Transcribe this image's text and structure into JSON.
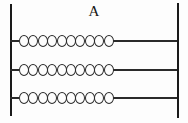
{
  "figure": {
    "title": "A",
    "background_color": "#fdfdfd",
    "stroke_color": "#2b2b2b",
    "width": 188,
    "height": 123
  },
  "vertical_rails": [
    {
      "name": "left-rail",
      "position": "left"
    },
    {
      "name": "right-rail",
      "position": "right"
    }
  ],
  "rows": [
    {
      "id": "row-1",
      "bead_count": 10,
      "bead_glyph": "O",
      "has_left_stub": true,
      "has_right_tail": true
    },
    {
      "id": "row-2",
      "bead_count": 10,
      "bead_glyph": "O",
      "has_left_stub": true,
      "has_right_tail": true
    },
    {
      "id": "row-3",
      "bead_count": 10,
      "bead_glyph": "O",
      "has_left_stub": true,
      "has_right_tail": true
    }
  ],
  "chart_data": {
    "type": "diagram",
    "title": "A",
    "categories": [
      "row-1",
      "row-2",
      "row-3"
    ],
    "values": [
      10,
      10,
      10
    ],
    "ylabel": "",
    "xlabel": ""
  }
}
